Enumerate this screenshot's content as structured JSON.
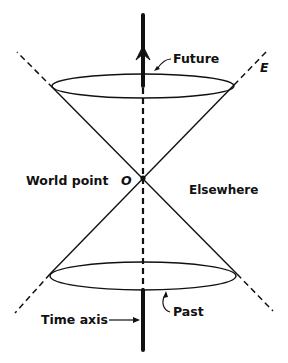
{
  "diagram": {
    "type": "light-cone",
    "labels": {
      "future": "Future",
      "past": "Past",
      "world_point": "World point",
      "origin": "O",
      "elsewhere": "Elsewhere",
      "time_axis": "Time axis",
      "edge": "E"
    },
    "colors": {
      "ink": "#111111",
      "background": "#ffffff"
    }
  }
}
